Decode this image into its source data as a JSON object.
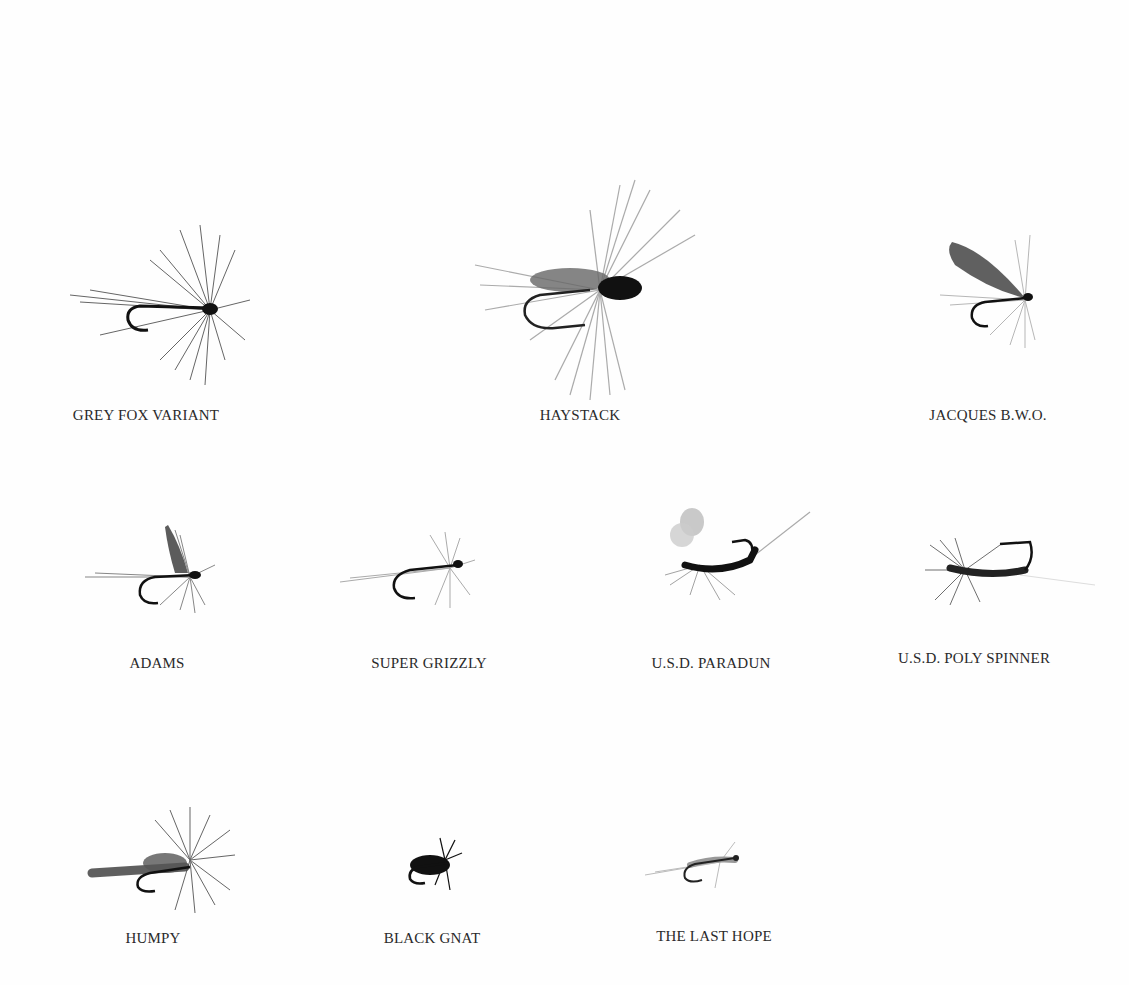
{
  "plate": {
    "background": "#fefefe",
    "ink_color": "#1a1a1a",
    "flies": [
      {
        "name": "GREY FOX VARIANT",
        "row": 1,
        "col": 1
      },
      {
        "name": "HAYSTACK",
        "row": 1,
        "col": 2
      },
      {
        "name": "JACQUES B.W.O.",
        "row": 1,
        "col": 3
      },
      {
        "name": "ADAMS",
        "row": 2,
        "col": 1
      },
      {
        "name": "SUPER GRIZZLY",
        "row": 2,
        "col": 2
      },
      {
        "name": "U.S.D. PARADUN",
        "row": 2,
        "col": 3
      },
      {
        "name": "U.S.D. POLY SPINNER",
        "row": 2,
        "col": 4
      },
      {
        "name": "HUMPY",
        "row": 3,
        "col": 1
      },
      {
        "name": "BLACK GNAT",
        "row": 3,
        "col": 2
      },
      {
        "name": "THE LAST HOPE",
        "row": 3,
        "col": 3
      }
    ]
  }
}
